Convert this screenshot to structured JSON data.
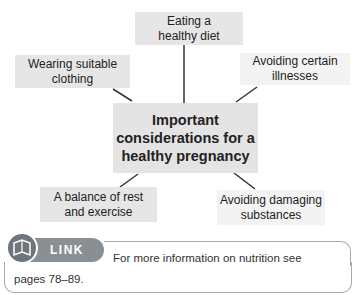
{
  "diagram": {
    "center": [
      "Important",
      "considerations for a",
      "healthy pregnancy"
    ],
    "nodes": [
      {
        "id": "diet",
        "lines": [
          "Eating a",
          "healthy diet"
        ]
      },
      {
        "id": "clothing",
        "lines": [
          "Wearing suitable",
          "clothing"
        ]
      },
      {
        "id": "illnesses",
        "lines": [
          "Avoiding certain",
          "illnesses"
        ]
      },
      {
        "id": "rest",
        "lines": [
          "A balance of rest",
          "and exercise"
        ]
      },
      {
        "id": "substances",
        "lines": [
          "Avoiding damaging",
          "substances"
        ]
      }
    ]
  },
  "link": {
    "badge": "LINK",
    "text_line1": "For more information on nutrition see",
    "text_line2": "pages 78–89."
  }
}
